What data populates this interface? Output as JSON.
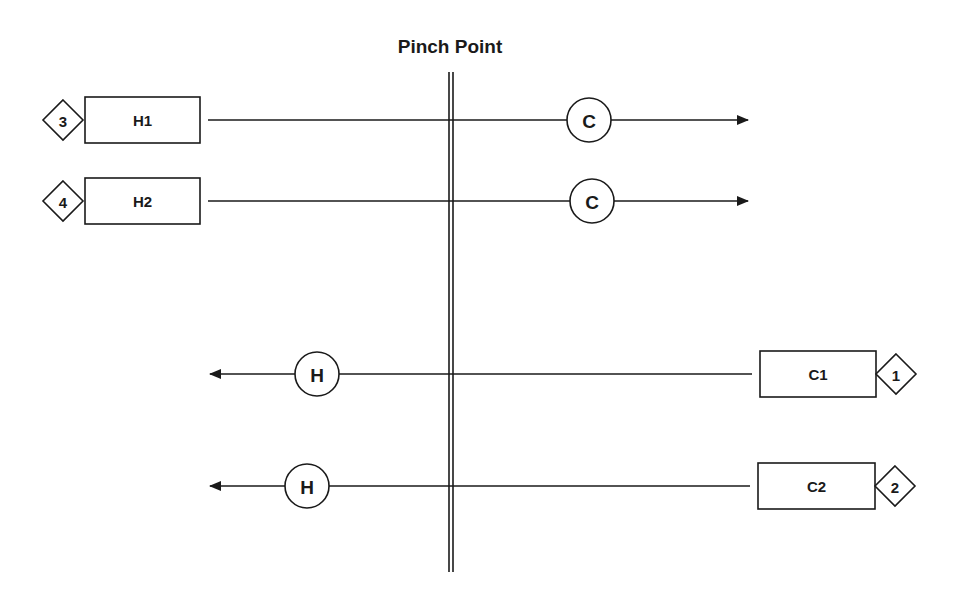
{
  "title": "Pinch Point",
  "colors": {
    "ink": "#1a1a1a",
    "background": "#ffffff"
  },
  "pinch_line": {
    "x": 451,
    "y1": 72,
    "y2": 572
  },
  "hot_streams": [
    {
      "id": "H1",
      "label": "H1",
      "number": "3",
      "y": 120,
      "box": {
        "x": 85,
        "w": 115,
        "h": 46
      },
      "line_x1": 208,
      "arrow_x2": 748,
      "exchanger": {
        "label": "C",
        "cx": 589,
        "r": 22
      }
    },
    {
      "id": "H2",
      "label": "H2",
      "number": "4",
      "y": 201,
      "box": {
        "x": 85,
        "w": 115,
        "h": 46
      },
      "line_x1": 208,
      "arrow_x2": 748,
      "exchanger": {
        "label": "C",
        "cx": 592,
        "r": 22
      }
    }
  ],
  "cold_streams": [
    {
      "id": "C1",
      "label": "C1",
      "number": "1",
      "y": 374,
      "box": {
        "x": 760,
        "w": 116,
        "h": 46
      },
      "line_x1": 752,
      "arrow_x2": 210,
      "exchanger": {
        "label": "H",
        "cx": 317,
        "r": 22
      }
    },
    {
      "id": "C2",
      "label": "C2",
      "number": "2",
      "y": 486,
      "box": {
        "x": 758,
        "w": 117,
        "h": 46
      },
      "line_x1": 750,
      "arrow_x2": 210,
      "exchanger": {
        "label": "H",
        "cx": 307,
        "r": 22
      }
    }
  ]
}
